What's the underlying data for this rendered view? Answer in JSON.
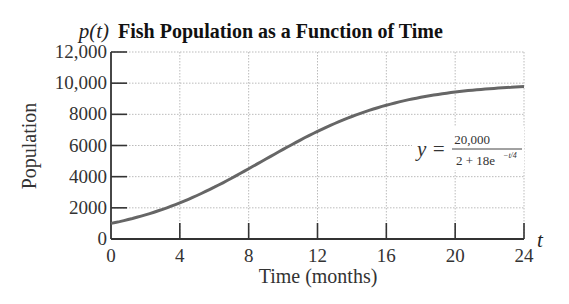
{
  "header": {
    "function_label": "p(t)",
    "title": "Fish Population as a Function of Time"
  },
  "axes": {
    "x_label": "Time (months)",
    "x_var": "t",
    "y_label": "Population",
    "x_ticks": [
      "0",
      "4",
      "8",
      "12",
      "16",
      "20",
      "24"
    ],
    "y_ticks": [
      "0",
      "2000",
      "4000",
      "6000",
      "8000",
      "10,000",
      "12,000"
    ]
  },
  "annotation": {
    "lhs": "y =",
    "numerator": "20,000",
    "denominator_base": "2 + 18e",
    "denominator_exp": "−t/4"
  },
  "colors": {
    "curve": "#666666",
    "grid": "#bbbbbb",
    "axis": "#333333"
  },
  "chart_data": {
    "type": "line",
    "title": "Fish Population as a Function of Time",
    "xlabel": "Time (months)",
    "ylabel": "Population",
    "xlim": [
      0,
      24
    ],
    "ylim": [
      0,
      12000
    ],
    "x_ticks": [
      0,
      4,
      8,
      12,
      16,
      20,
      24
    ],
    "y_ticks": [
      0,
      2000,
      4000,
      6000,
      8000,
      10000,
      12000
    ],
    "grid": true,
    "annotations": [
      "p(t)",
      "y = 20,000 / (2 + 18e^(−t/4))",
      "t"
    ],
    "series": [
      {
        "name": "p(t) = 20000/(2+18e^(-t/4))",
        "x": [
          0,
          2,
          4,
          6,
          8,
          10,
          12,
          14,
          16,
          18,
          20,
          22,
          24
        ],
        "values": [
          1000,
          1548,
          2320,
          3324,
          4509,
          5752,
          6906,
          7864,
          8585,
          9091,
          9429,
          9646,
          9782
        ]
      }
    ]
  }
}
